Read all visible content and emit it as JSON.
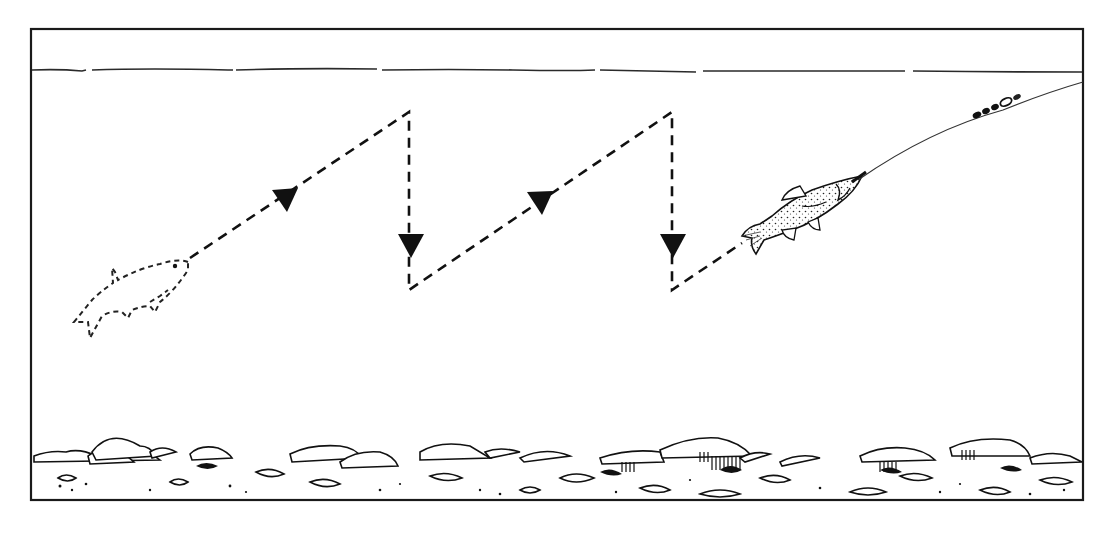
{
  "diagram": {
    "type": "illustration",
    "colors": {
      "ink": "#1a1a1a",
      "background": "#ffffff",
      "line": "#555555"
    },
    "frame": {
      "x": 31,
      "y": 29,
      "width": 1052,
      "height": 471
    },
    "water_surface_y": 70,
    "path": {
      "style": "dashed",
      "points": [
        [
          190,
          258
        ],
        [
          409,
          112
        ],
        [
          409,
          290
        ],
        [
          672,
          112
        ],
        [
          672,
          290
        ],
        [
          742,
          243
        ]
      ],
      "arrows": [
        {
          "x": 286,
          "y": 199,
          "direction": "along-up-right"
        },
        {
          "x": 411,
          "y": 245,
          "direction": "down"
        },
        {
          "x": 540,
          "y": 202,
          "direction": "along-up-right"
        },
        {
          "x": 673,
          "y": 245,
          "direction": "down"
        }
      ]
    },
    "elements": [
      {
        "name": "start-fish-outline",
        "style": "dashed outline",
        "x": 130,
        "y": 290
      },
      {
        "name": "baitfish-on-hook",
        "style": "stippled drawing",
        "x": 800,
        "y": 210
      },
      {
        "name": "fishing-line-with-swivel-and-shot",
        "from": [
          860,
          178
        ],
        "to": [
          1083,
          82
        ]
      },
      {
        "name": "riverbed-stones",
        "y_range": [
          440,
          500
        ]
      }
    ]
  }
}
